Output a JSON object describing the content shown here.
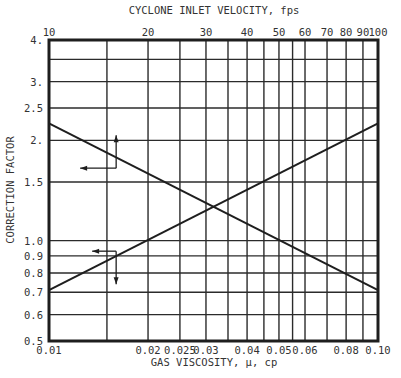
{
  "chart_data": {
    "type": "line",
    "title": "",
    "xlabel": "GAS VISCOSITY, μ, cp",
    "x2label": "CYCLONE INLET VELOCITY, fps",
    "ylabel": "CORRECTION FACTOR",
    "xscale": "log",
    "yscale": "log",
    "xlim": [
      0.01,
      0.1
    ],
    "x2lim": [
      10,
      100
    ],
    "ylim": [
      0.5,
      4.0
    ],
    "grid": true,
    "legend": "none",
    "x_tick_labels": [
      "0.01",
      "0.02",
      "0.025",
      "0.03",
      "0.04",
      "0.05",
      "0.06",
      "0.08",
      "0.10"
    ],
    "x_tick_values": [
      0.01,
      0.02,
      0.025,
      0.03,
      0.04,
      0.05,
      0.06,
      0.08,
      0.1
    ],
    "x2_tick_labels": [
      "10",
      "20",
      "30",
      "40",
      "50",
      "60",
      "70",
      "80",
      "90",
      "100"
    ],
    "x2_tick_values": [
      10,
      20,
      30,
      40,
      50,
      60,
      70,
      80,
      90,
      100
    ],
    "y_tick_labels": [
      "4.",
      "3.",
      "2.5",
      "2.",
      "1.5",
      "1.0",
      "0.9",
      "0.8",
      "0.7",
      "0.6",
      "0.5"
    ],
    "y_tick_values": [
      4.0,
      3.0,
      2.5,
      2.0,
      1.5,
      1.0,
      0.9,
      0.8,
      0.7,
      0.6,
      0.5
    ],
    "x_gridlines": [
      0.01,
      0.015,
      0.02,
      0.025,
      0.03,
      0.035,
      0.04,
      0.045,
      0.05,
      0.055,
      0.06,
      0.07,
      0.08,
      0.09,
      0.1
    ],
    "y_gridlines": [
      4.0,
      3.5,
      3.0,
      2.5,
      2.0,
      1.5,
      1.0,
      0.9,
      0.8,
      0.7,
      0.6,
      0.5
    ],
    "series": [
      {
        "name": "Viscosity correction (read on bottom axis)",
        "axis": "bottom",
        "x": [
          0.01,
          0.1
        ],
        "y": [
          0.71,
          2.25
        ]
      },
      {
        "name": "Inlet velocity correction (read on top axis)",
        "axis": "top",
        "x": [
          10,
          100
        ],
        "y": [
          2.25,
          0.71
        ]
      }
    ],
    "annotations": [
      {
        "type": "arrow-pair",
        "on_series": "Inlet velocity correction",
        "x": 16,
        "y": 1.65,
        "arrows": [
          "up",
          "left"
        ]
      },
      {
        "type": "arrow-pair",
        "on_series": "Viscosity correction",
        "x": 0.016,
        "y": 0.93,
        "arrows": [
          "left",
          "down"
        ]
      }
    ]
  },
  "labels": {
    "top_axis_title": "CYCLONE INLET VELOCITY, fps",
    "bottom_axis_title": "GAS VISCOSITY, μ, cp",
    "y_axis_title": "CORRECTION FACTOR"
  },
  "colors": {
    "line": "#1e1e1e",
    "grid": "#2b2b2b",
    "text": "#333333",
    "background": "#ffffff"
  }
}
